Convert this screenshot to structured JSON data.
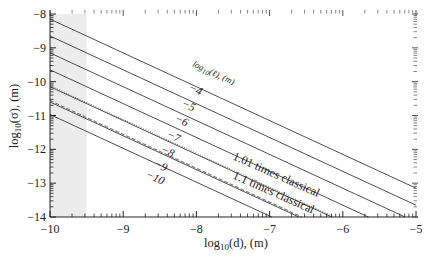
{
  "chart_data": {
    "type": "line",
    "title": "",
    "xlabel": "log10(d), (m)",
    "ylabel": "log10(σ), (m)",
    "xlim": [
      -10,
      -5
    ],
    "ylim": [
      -14,
      -8
    ],
    "xticks": [
      -10,
      -9,
      -8,
      -7,
      -6,
      -5
    ],
    "yticks": [
      -14,
      -13,
      -12,
      -11,
      -10,
      -9,
      -8
    ],
    "xtick_labels": [
      "−10",
      "−9",
      "−8",
      "−7",
      "−6",
      "−5"
    ],
    "ytick_labels": [
      "−14",
      "−13",
      "−12",
      "−11",
      "−10",
      "−9",
      "−8"
    ],
    "grid": false,
    "legend": "none (inline labels)",
    "shaded_region": {
      "x": [
        -10,
        -9.5
      ],
      "color": "#ececec"
    },
    "family_label": "log10(ℓ), (m)",
    "series": [
      {
        "name": "-4",
        "style": "solid",
        "x": [
          -10,
          -5
        ],
        "y": [
          -8.15,
          -13.15
        ]
      },
      {
        "name": "-5",
        "style": "solid",
        "x": [
          -10,
          -5
        ],
        "y": [
          -8.65,
          -13.65
        ]
      },
      {
        "name": "-6",
        "style": "solid",
        "x": [
          -10,
          -5.15
        ],
        "y": [
          -9.15,
          -14.0
        ]
      },
      {
        "name": "-7",
        "style": "solid",
        "x": [
          -10,
          -5.65
        ],
        "y": [
          -9.65,
          -14.0
        ]
      },
      {
        "name": "-8",
        "style": "solid",
        "x": [
          -10,
          -6.15
        ],
        "y": [
          -10.15,
          -14.0
        ]
      },
      {
        "name": "-9",
        "style": "solid",
        "x": [
          -10,
          -6.6
        ],
        "y": [
          -10.6,
          -14.0
        ]
      },
      {
        "name": "-10",
        "style": "solid",
        "x": [
          -10,
          -6.97
        ],
        "y": [
          -10.97,
          -14.0
        ]
      },
      {
        "name": "1.01 times classical",
        "style": "dotted",
        "x": [
          -10,
          -6.12
        ],
        "y": [
          -10.12,
          -14.0
        ]
      },
      {
        "name": "1.1 times classical",
        "style": "dashed",
        "x": [
          -10,
          -6.56
        ],
        "y": [
          -10.56,
          -14.0
        ]
      }
    ],
    "annotations": [
      "log10(ℓ), (m)",
      "−4",
      "−5",
      "−6",
      "−7",
      "−8",
      "−9",
      "−10",
      "1.01 times classical",
      "1.1 times classical"
    ]
  },
  "labels": {
    "xlabel_main": "log",
    "xlabel_sub": "10",
    "xlabel_rest": "(d), (m)",
    "ylabel_main": "log",
    "ylabel_sub": "10",
    "ylabel_rest": "(σ), (m)",
    "family_main": "log",
    "family_sub": "10",
    "family_rest": "(ℓ), (m)",
    "curve_labels": [
      "−4",
      "−5",
      "−6",
      "−7",
      "−8",
      "−9",
      "−10"
    ],
    "dotted_label": "1.01 times classical",
    "dashed_label": "1.1 times classical"
  },
  "colors": {
    "line": "#3a3a3a",
    "shade": "#ececec",
    "axis": "#222222"
  }
}
